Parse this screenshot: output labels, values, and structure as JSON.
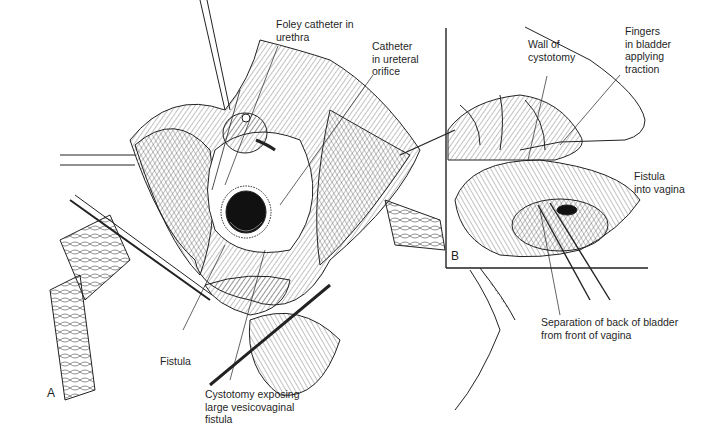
{
  "figure": {
    "panels": [
      {
        "id": "A",
        "letter": "A"
      },
      {
        "id": "B",
        "letter": "B"
      }
    ],
    "labels": {
      "foley_l1": "Foley catheter in",
      "foley_l2": "urethra",
      "ureteral_l1": "Catheter",
      "ureteral_l2": "in ureteral",
      "ureteral_l3": "orifice",
      "fistula": "Fistula",
      "cystotomy_l1": "Cystotomy exposing",
      "cystotomy_l2": "large vesicovaginal",
      "cystotomy_l3": "fistula",
      "wall_l1": "Wall of",
      "wall_l2": "cystotomy",
      "fingers_l1": "Fingers",
      "fingers_l2": "in bladder",
      "fingers_l3": "applying",
      "fingers_l4": "traction",
      "fistula_vagina_l1": "Fistula",
      "fistula_vagina_l2": "into vagina",
      "separation_l1": "Separation of back of bladder",
      "separation_l2": "from front of vagina"
    },
    "colors": {
      "ink": "#1f1f1f",
      "background": "#ffffff",
      "cavity": "#111111"
    }
  }
}
